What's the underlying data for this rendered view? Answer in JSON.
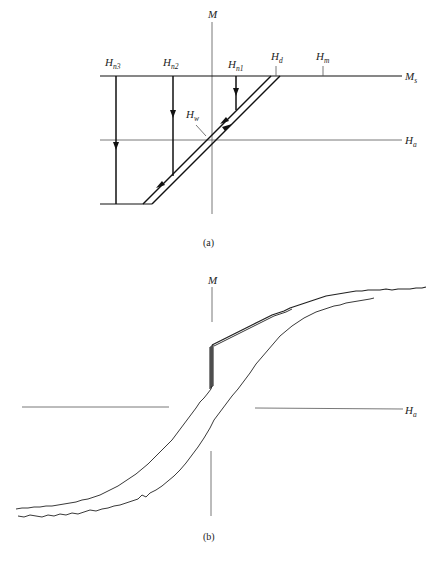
{
  "panel_a": {
    "caption": "(a)",
    "m_axis_label": "M",
    "ms_label": {
      "main": "M",
      "sub": "s"
    },
    "ha_label": {
      "main": "H",
      "sub": "a"
    },
    "hn3_label": {
      "main": "H",
      "sub": "n3"
    },
    "hn2_label": {
      "main": "H",
      "sub": "n2"
    },
    "hn1_label": {
      "main": "H",
      "sub": "n1"
    },
    "hd_label": {
      "main": "H",
      "sub": "d"
    },
    "hm_label": {
      "main": "H",
      "sub": "m"
    },
    "hw_label": {
      "main": "H",
      "sub": "w"
    }
  },
  "panel_b": {
    "caption": "(b)",
    "m_axis_label": "M",
    "ha_label": {
      "main": "H",
      "sub": "a"
    }
  },
  "colors": {
    "line": "#111111",
    "axis": "#555555",
    "background": "#ffffff"
  }
}
